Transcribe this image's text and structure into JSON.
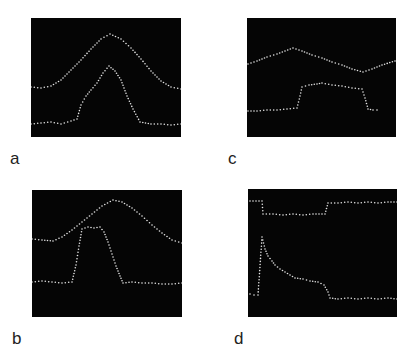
{
  "figure": {
    "panels": [
      {
        "id": "a",
        "label": "a"
      },
      {
        "id": "b",
        "label": "b"
      },
      {
        "id": "c",
        "label": "c"
      },
      {
        "id": "d",
        "label": "d"
      }
    ]
  },
  "chart_data": [
    {
      "panel": "a",
      "type": "scatter",
      "title": "",
      "xlabel": "",
      "ylabel": "",
      "grid": false,
      "background": "#050505",
      "point_color": "#e6e6e6",
      "series": [
        {
          "name": "upper trace (bell)",
          "points": [
            [
              0,
              69
            ],
            [
              10,
              70
            ],
            [
              20,
              68
            ],
            [
              30,
              62
            ],
            [
              40,
              52
            ],
            [
              50,
              42
            ],
            [
              60,
              31
            ],
            [
              70,
              21
            ],
            [
              79,
              16
            ],
            [
              90,
              21
            ],
            [
              100,
              30
            ],
            [
              110,
              41
            ],
            [
              120,
              53
            ],
            [
              130,
              63
            ],
            [
              140,
              69
            ],
            [
              150,
              71
            ]
          ]
        },
        {
          "name": "lower trace (peak)",
          "points": [
            [
              0,
              106
            ],
            [
              10,
              105
            ],
            [
              20,
              104
            ],
            [
              30,
              106
            ],
            [
              40,
              103
            ],
            [
              46,
              101
            ],
            [
              50,
              87
            ],
            [
              55,
              78
            ],
            [
              60,
              72
            ],
            [
              66,
              65
            ],
            [
              72,
              55
            ],
            [
              78,
              48
            ],
            [
              84,
              53
            ],
            [
              90,
              62
            ],
            [
              96,
              78
            ],
            [
              102,
              91
            ],
            [
              109,
              104
            ],
            [
              120,
              106
            ],
            [
              130,
              106
            ],
            [
              140,
              107
            ],
            [
              150,
              106
            ]
          ]
        }
      ]
    },
    {
      "panel": "b",
      "type": "scatter",
      "title": "",
      "xlabel": "",
      "ylabel": "",
      "grid": false,
      "background": "#050505",
      "point_color": "#e6e6e6",
      "series": [
        {
          "name": "upper trace (bell)",
          "points": [
            [
              0,
              49
            ],
            [
              10,
              50
            ],
            [
              21,
              51
            ],
            [
              30,
              47
            ],
            [
              40,
              40
            ],
            [
              50,
              32
            ],
            [
              60,
              24
            ],
            [
              70,
              16
            ],
            [
              81,
              10
            ],
            [
              90,
              12
            ],
            [
              100,
              18
            ],
            [
              110,
              26
            ],
            [
              120,
              35
            ],
            [
              130,
              43
            ],
            [
              140,
              50
            ],
            [
              150,
              53
            ]
          ]
        },
        {
          "name": "lower trace (peak)",
          "points": [
            [
              0,
              92
            ],
            [
              10,
              91
            ],
            [
              20,
              92
            ],
            [
              30,
              93
            ],
            [
              40,
              92
            ],
            [
              44,
              75
            ],
            [
              47,
              56
            ],
            [
              50,
              39
            ],
            [
              56,
              37
            ],
            [
              62,
              38
            ],
            [
              68,
              37
            ],
            [
              72,
              42
            ],
            [
              76,
              52
            ],
            [
              80,
              64
            ],
            [
              84,
              76
            ],
            [
              88,
              86
            ],
            [
              91,
              93
            ],
            [
              100,
              92
            ],
            [
              110,
              93
            ],
            [
              120,
              93
            ],
            [
              130,
              94
            ],
            [
              140,
              94
            ],
            [
              150,
              93
            ]
          ]
        }
      ]
    },
    {
      "panel": "c",
      "type": "scatter",
      "title": "",
      "xlabel": "",
      "ylabel": "",
      "grid": false,
      "background": "#050505",
      "point_color": "#e6e6e6",
      "series": [
        {
          "name": "upper trace (zigzag)",
          "points": [
            [
              1,
              46
            ],
            [
              10,
              43
            ],
            [
              20,
              39
            ],
            [
              30,
              36
            ],
            [
              38,
              33
            ],
            [
              46,
              30
            ],
            [
              55,
              33
            ],
            [
              65,
              37
            ],
            [
              75,
              40
            ],
            [
              85,
              44
            ],
            [
              95,
              47
            ],
            [
              105,
              51
            ],
            [
              116,
              54
            ],
            [
              125,
              51
            ],
            [
              135,
              47
            ],
            [
              148,
              43
            ]
          ]
        },
        {
          "name": "lower trace (step)",
          "points": [
            [
              1,
              93
            ],
            [
              10,
              93
            ],
            [
              20,
              92
            ],
            [
              30,
              92
            ],
            [
              40,
              91
            ],
            [
              50,
              90
            ],
            [
              53,
              78
            ],
            [
              55,
              69
            ],
            [
              62,
              67
            ],
            [
              70,
              66
            ],
            [
              75,
              65
            ],
            [
              85,
              67
            ],
            [
              95,
              68
            ],
            [
              105,
              70
            ],
            [
              115,
              71
            ],
            [
              118,
              80
            ],
            [
              121,
              91
            ],
            [
              126,
              92
            ],
            [
              130,
              92
            ]
          ]
        }
      ]
    },
    {
      "panel": "d",
      "type": "scatter",
      "title": "",
      "xlabel": "",
      "ylabel": "",
      "grid": false,
      "background": "#050505",
      "point_color": "#e6e6e6",
      "series": [
        {
          "name": "upper trace (steps)",
          "points": [
            [
              2,
              12
            ],
            [
              8,
              12
            ],
            [
              14,
              12
            ],
            [
              15,
              25
            ],
            [
              25,
              25
            ],
            [
              35,
              26
            ],
            [
              45,
              25
            ],
            [
              55,
              26
            ],
            [
              65,
              25
            ],
            [
              77,
              25
            ],
            [
              80,
              14
            ],
            [
              90,
              14
            ],
            [
              100,
              13
            ],
            [
              110,
              14
            ],
            [
              120,
              13
            ],
            [
              130,
              14
            ],
            [
              140,
              13
            ],
            [
              149,
              13
            ]
          ]
        },
        {
          "name": "lower trace (decay)",
          "points": [
            [
              2,
              105
            ],
            [
              6,
              106
            ],
            [
              10,
              106
            ],
            [
              14,
              48
            ],
            [
              17,
              60
            ],
            [
              20,
              67
            ],
            [
              24,
              72
            ],
            [
              27,
              76
            ],
            [
              32,
              80
            ],
            [
              37,
              83
            ],
            [
              42,
              86
            ],
            [
              47,
              89
            ],
            [
              55,
              90
            ],
            [
              62,
              92
            ],
            [
              70,
              93
            ],
            [
              76,
              96
            ],
            [
              80,
              103
            ],
            [
              82,
              109
            ],
            [
              90,
              110
            ],
            [
              100,
              109
            ],
            [
              110,
              110
            ],
            [
              120,
              109
            ],
            [
              130,
              110
            ],
            [
              140,
              109
            ],
            [
              149,
              110
            ]
          ]
        }
      ]
    }
  ]
}
